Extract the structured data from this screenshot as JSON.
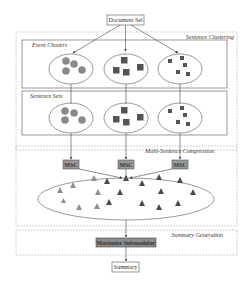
{
  "diagram": {
    "input_box": "Document Set",
    "output_box": "Summary",
    "regions": {
      "sentence_clustering": "Sentence Clustering",
      "multi_sentence_compression": "Multi-Sentence Compression",
      "summary_generation": "Summary Generation"
    },
    "sub_boxes": {
      "event_clusters": "Event Clusters",
      "sentence_sets": "Sentence Sets"
    },
    "msc_boxes": [
      "MSC",
      "MSC",
      "MSC"
    ],
    "optimizer_box": "Maximize Submodular",
    "cluster_shapes": [
      "circle",
      "square-large",
      "square-small"
    ],
    "colors": {
      "circle_fill": "#8a8a8a",
      "square_fill": "#555555",
      "triangle_light": "#8f8f8f",
      "triangle_dark": "#4a4a4a",
      "msc_fill": "#9a9a9a",
      "optimizer_fill": "#8c8c8c",
      "stroke": "#555555"
    }
  }
}
